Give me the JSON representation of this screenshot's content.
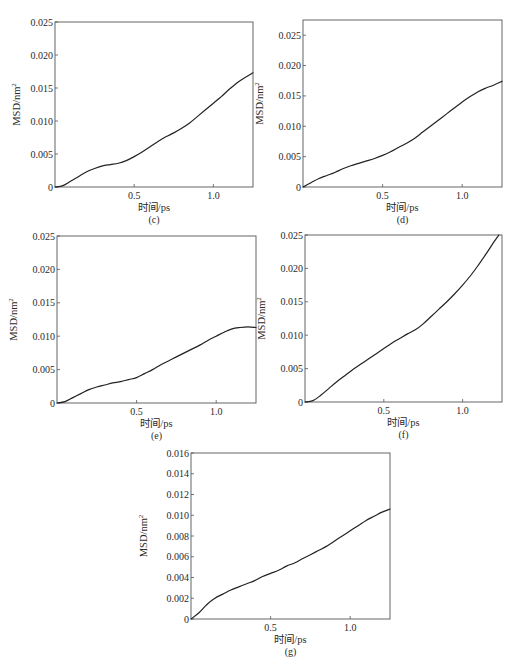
{
  "figure": {
    "line_color": "#222222",
    "frame_color": "#555555"
  },
  "chart_data": [
    {
      "type": "line",
      "panel_label": "(c)",
      "title": "",
      "xlabel": "时间/ps",
      "ylabel": "MSD/nm",
      "ylabel_sup": "2",
      "xlim": [
        0,
        1.25
      ],
      "ylim": [
        0,
        0.025
      ],
      "xticks": [
        0.5,
        1.0
      ],
      "xtick_labels": [
        "0.5",
        "1.0"
      ],
      "yticks": [
        0,
        0.005,
        0.01,
        0.015,
        0.02,
        0.025
      ],
      "ytick_labels": [
        "0",
        "0.005",
        "0.010",
        "0.015",
        "0.020",
        "0.025"
      ],
      "grid": false,
      "series": [
        {
          "name": "MSD",
          "x": [
            0,
            0.05,
            0.1,
            0.15,
            0.2,
            0.25,
            0.3,
            0.35,
            0.4,
            0.45,
            0.5,
            0.55,
            0.6,
            0.65,
            0.7,
            0.75,
            0.8,
            0.85,
            0.9,
            0.95,
            1.0,
            1.05,
            1.1,
            1.15,
            1.2,
            1.25
          ],
          "y": [
            0,
            0.0002,
            0.0009,
            0.0016,
            0.0023,
            0.0028,
            0.0032,
            0.0034,
            0.0036,
            0.004,
            0.0046,
            0.0053,
            0.0061,
            0.0069,
            0.0076,
            0.0082,
            0.0089,
            0.0097,
            0.0107,
            0.0117,
            0.0127,
            0.0137,
            0.0148,
            0.0158,
            0.0166,
            0.0173
          ]
        }
      ]
    },
    {
      "type": "line",
      "panel_label": "(d)",
      "title": "",
      "xlabel": "时间/ps",
      "ylabel": "MSD/nm",
      "ylabel_sup": "2",
      "xlim": [
        0,
        1.25
      ],
      "ylim": [
        0,
        0.0275
      ],
      "xticks": [
        0.5,
        1.0
      ],
      "xtick_labels": [
        "0.5",
        "1.0"
      ],
      "yticks": [
        0,
        0.005,
        0.01,
        0.015,
        0.02,
        0.025
      ],
      "ytick_labels": [
        "0",
        "0.005",
        "0.010",
        "0.015",
        "0.020",
        "0.025"
      ],
      "grid": false,
      "series": [
        {
          "name": "MSD",
          "x": [
            0,
            0.05,
            0.1,
            0.15,
            0.2,
            0.25,
            0.3,
            0.35,
            0.4,
            0.45,
            0.5,
            0.55,
            0.6,
            0.65,
            0.7,
            0.75,
            0.8,
            0.85,
            0.9,
            0.95,
            1.0,
            1.05,
            1.1,
            1.15,
            1.2,
            1.25
          ],
          "y": [
            0,
            0.0007,
            0.0014,
            0.0019,
            0.0024,
            0.003,
            0.0035,
            0.0039,
            0.0043,
            0.0047,
            0.0052,
            0.0058,
            0.0065,
            0.0072,
            0.008,
            0.009,
            0.01,
            0.011,
            0.012,
            0.013,
            0.014,
            0.0149,
            0.0157,
            0.0163,
            0.0168,
            0.0174
          ]
        }
      ]
    },
    {
      "type": "line",
      "panel_label": "(e)",
      "title": "",
      "xlabel": "时间/ps",
      "ylabel": "MSD/nm",
      "ylabel_sup": "2",
      "xlim": [
        0,
        1.25
      ],
      "ylim": [
        0,
        0.025
      ],
      "xticks": [
        0.5,
        1.0
      ],
      "xtick_labels": [
        "0.5",
        "1.0"
      ],
      "yticks": [
        0,
        0.005,
        0.01,
        0.015,
        0.02,
        0.025
      ],
      "ytick_labels": [
        "0",
        "0.005",
        "0.010",
        "0.015",
        "0.020",
        "0.025"
      ],
      "grid": false,
      "series": [
        {
          "name": "MSD",
          "x": [
            0,
            0.05,
            0.1,
            0.15,
            0.2,
            0.25,
            0.3,
            0.35,
            0.4,
            0.45,
            0.5,
            0.55,
            0.6,
            0.65,
            0.7,
            0.75,
            0.8,
            0.85,
            0.9,
            0.95,
            1.0,
            1.05,
            1.1,
            1.15,
            1.2,
            1.25
          ],
          "y": [
            0,
            0.0002,
            0.0008,
            0.0014,
            0.002,
            0.0024,
            0.0027,
            0.003,
            0.0032,
            0.0035,
            0.0038,
            0.0044,
            0.005,
            0.0057,
            0.0063,
            0.0069,
            0.0075,
            0.0081,
            0.0087,
            0.0094,
            0.01,
            0.0106,
            0.0111,
            0.0113,
            0.0114,
            0.0113
          ]
        }
      ]
    },
    {
      "type": "line",
      "panel_label": "(f)",
      "title": "",
      "xlabel": "时间/ps",
      "ylabel": "MSD/nm",
      "ylabel_sup": "2",
      "xlim": [
        0,
        1.25
      ],
      "ylim": [
        0,
        0.025
      ],
      "xticks": [
        0.5,
        1.0
      ],
      "xtick_labels": [
        "0.5",
        "1.0"
      ],
      "yticks": [
        0,
        0.005,
        0.01,
        0.015,
        0.02,
        0.025
      ],
      "ytick_labels": [
        "0",
        "0.005",
        "0.010",
        "0.015",
        "0.020",
        "0.025"
      ],
      "grid": false,
      "series": [
        {
          "name": "MSD",
          "x": [
            0,
            0.05,
            0.1,
            0.15,
            0.2,
            0.25,
            0.3,
            0.35,
            0.4,
            0.45,
            0.5,
            0.55,
            0.6,
            0.65,
            0.7,
            0.75,
            0.8,
            0.85,
            0.9,
            0.95,
            1.0,
            1.05,
            1.1,
            1.15,
            1.2,
            1.23
          ],
          "y": [
            0,
            0.0002,
            0.001,
            0.002,
            0.003,
            0.0039,
            0.0048,
            0.0056,
            0.0064,
            0.0072,
            0.008,
            0.0088,
            0.0095,
            0.0102,
            0.0108,
            0.0117,
            0.0128,
            0.0139,
            0.015,
            0.0162,
            0.0175,
            0.0189,
            0.0205,
            0.0222,
            0.024,
            0.025
          ]
        }
      ]
    },
    {
      "type": "line",
      "panel_label": "(g)",
      "title": "",
      "xlabel": "时间/ps",
      "ylabel": "MSD/nm",
      "ylabel_sup": "2",
      "xlim": [
        0,
        1.25
      ],
      "ylim": [
        0,
        0.016
      ],
      "xticks": [
        0.5,
        1.0
      ],
      "xtick_labels": [
        "0.5",
        "1.0"
      ],
      "yticks": [
        0,
        0.002,
        0.004,
        0.006,
        0.008,
        0.01,
        0.012,
        0.014,
        0.016
      ],
      "ytick_labels": [
        "0",
        "0.002",
        "0.004",
        "0.006",
        "0.008",
        "0.010",
        "0.012",
        "0.014",
        "0.016"
      ],
      "grid": false,
      "series": [
        {
          "name": "MSD",
          "x": [
            0,
            0.05,
            0.1,
            0.15,
            0.2,
            0.25,
            0.3,
            0.35,
            0.4,
            0.45,
            0.5,
            0.55,
            0.6,
            0.65,
            0.7,
            0.75,
            0.8,
            0.85,
            0.9,
            0.95,
            1.0,
            1.05,
            1.1,
            1.15,
            1.2,
            1.25
          ],
          "y": [
            0,
            0.0006,
            0.0014,
            0.002,
            0.0024,
            0.0028,
            0.0031,
            0.0034,
            0.0037,
            0.0041,
            0.0044,
            0.0047,
            0.0051,
            0.0054,
            0.0058,
            0.0062,
            0.0066,
            0.007,
            0.0075,
            0.008,
            0.0085,
            0.009,
            0.0095,
            0.0099,
            0.0103,
            0.0106
          ]
        }
      ]
    }
  ]
}
